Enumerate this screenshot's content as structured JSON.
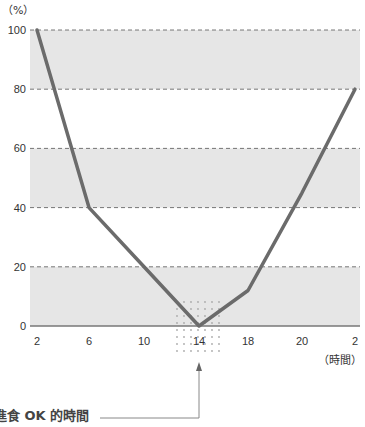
{
  "chart_data": {
    "type": "line",
    "title": "",
    "xlabel": "(時間)",
    "ylabel": "(%)",
    "x": [
      "2",
      "6",
      "10",
      "14",
      "18",
      "20",
      "2"
    ],
    "ylim": [
      0,
      100
    ],
    "yticks": [
      0,
      20,
      40,
      60,
      80,
      100
    ],
    "grid": "dashed horizontal",
    "shaded_bands": [
      [
        0,
        20
      ],
      [
        40,
        60
      ],
      [
        80,
        100
      ]
    ],
    "series": [
      {
        "name": "",
        "values": [
          100,
          40,
          20,
          0,
          12,
          45,
          80
        ],
        "color": "#6b6b6b"
      }
    ],
    "annotations": [
      {
        "text": "進食 OK 的時間",
        "target_x": "14",
        "style": "arrow pointing to x=14, dotted highlight around minimum"
      }
    ]
  },
  "labels": {
    "y_unit": "（%）",
    "x_unit": "（時間）",
    "caption": "進食 OK 的時間"
  },
  "colors": {
    "band": "#e6e6e6",
    "line": "#6b6b6b",
    "grid": "#555555"
  }
}
